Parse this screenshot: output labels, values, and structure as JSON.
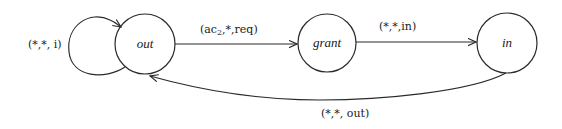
{
  "diagram": {
    "type": "state-machine",
    "states": [
      {
        "id": "out",
        "label": "out"
      },
      {
        "id": "grant",
        "label": "grant"
      },
      {
        "id": "in",
        "label": "in"
      }
    ],
    "transitions": [
      {
        "from": "out",
        "to": "out",
        "label": "(*,*, i)"
      },
      {
        "from": "out",
        "to": "grant",
        "label_prefix": "(ac",
        "label_sub": "2",
        "label_suffix": ",*,req)"
      },
      {
        "from": "grant",
        "to": "in",
        "label": "(*,*,in)"
      },
      {
        "from": "in",
        "to": "out",
        "label": "(*,*, out)"
      }
    ]
  }
}
